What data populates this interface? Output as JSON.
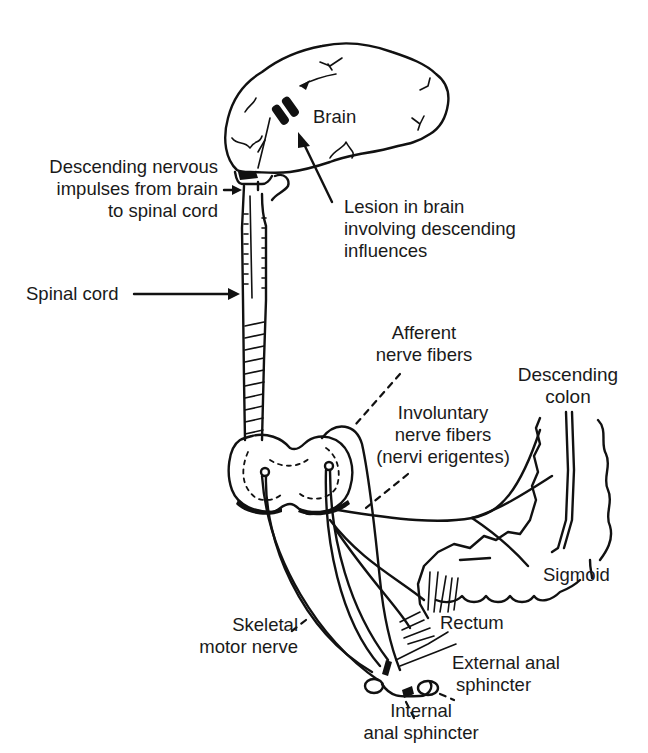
{
  "figure": {
    "ink_color": "#111111",
    "background": "#ffffff"
  },
  "labels": {
    "brain": "Brain",
    "descending": [
      "Descending nervous",
      "impulses from brain",
      "to spinal cord"
    ],
    "lesion": [
      "Lesion in brain",
      "involving descending",
      "influences"
    ],
    "spinal_cord": "Spinal cord",
    "afferent": [
      "Afferent",
      "nerve fibers"
    ],
    "descending_colon": [
      "Descending",
      "colon"
    ],
    "involuntary": [
      "Involuntary",
      "nerve fibers",
      "(nervi erigentes)"
    ],
    "sigmoid": "Sigmoid",
    "rectum": "Rectum",
    "skeletal": [
      "Skeletal",
      "motor nerve"
    ],
    "external": [
      "External anal",
      "sphincter"
    ],
    "internal": [
      "Internal",
      "anal sphincter"
    ]
  }
}
